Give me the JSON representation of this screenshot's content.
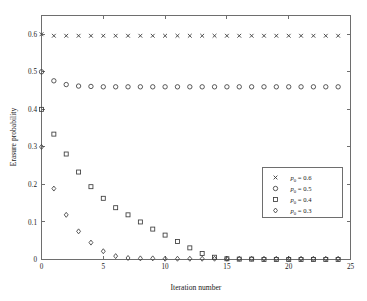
{
  "chart_data": {
    "type": "scatter",
    "title": "",
    "xlabel": "Iteration number",
    "ylabel": "Erasure probability",
    "xlim": [
      0,
      25
    ],
    "ylim": [
      0,
      0.65
    ],
    "xticks": [
      0,
      5,
      10,
      15,
      20,
      25
    ],
    "xticklabels": [
      "0",
      "5",
      "10",
      "15",
      "20",
      "25"
    ],
    "yticks": [
      0,
      0.1,
      0.2,
      0.3,
      0.4,
      0.5,
      0.6
    ],
    "yticklabels": [
      "0",
      "0.1",
      "0.2",
      "0.3",
      "0.4",
      "0.5",
      "0.6"
    ],
    "grid": false,
    "legend_position": "center-right",
    "x": [
      0,
      1,
      2,
      3,
      4,
      5,
      6,
      7,
      8,
      9,
      10,
      11,
      12,
      13,
      14,
      15,
      16,
      17,
      18,
      19,
      20,
      21,
      22,
      23,
      24
    ],
    "series": [
      {
        "name": "p_0 = 0.6",
        "marker": "x",
        "color": "#3c3c3c",
        "values": [
          0.6,
          0.596,
          0.596,
          0.596,
          0.596,
          0.596,
          0.596,
          0.596,
          0.596,
          0.596,
          0.596,
          0.596,
          0.596,
          0.596,
          0.596,
          0.596,
          0.596,
          0.596,
          0.596,
          0.596,
          0.596,
          0.596,
          0.596,
          0.596,
          0.596
        ]
      },
      {
        "name": "p_0 = 0.5",
        "marker": "o",
        "color": "#3c3c3c",
        "values": [
          0.5,
          0.476,
          0.466,
          0.462,
          0.461,
          0.46,
          0.46,
          0.46,
          0.46,
          0.46,
          0.46,
          0.46,
          0.46,
          0.46,
          0.46,
          0.46,
          0.46,
          0.46,
          0.46,
          0.46,
          0.46,
          0.46,
          0.46,
          0.46,
          0.46
        ]
      },
      {
        "name": "p_0 = 0.4",
        "marker": "s",
        "color": "#3c3c3c",
        "values": [
          0.4,
          0.334,
          0.281,
          0.233,
          0.194,
          0.163,
          0.138,
          0.119,
          0.1,
          0.081,
          0.065,
          0.048,
          0.031,
          0.016,
          0.006,
          0.002,
          0.001,
          0.001,
          0.0,
          0.0,
          0.0,
          0.0,
          0.0,
          0.0,
          0.0
        ]
      },
      {
        "name": "p_0 = 0.3",
        "marker": "d",
        "color": "#3c3c3c",
        "values": [
          0.3,
          0.189,
          0.119,
          0.075,
          0.045,
          0.022,
          0.009,
          0.004,
          0.003,
          0.003,
          0.002,
          0.002,
          0.002,
          0.002,
          0.002,
          0.002,
          0.002,
          0.002,
          0.002,
          0.002,
          0.002,
          0.002,
          0.002,
          0.002,
          0.002
        ]
      }
    ],
    "legend_entries": [
      {
        "marker": "x",
        "text": "p",
        "sub": "0",
        "rest": " = 0.6"
      },
      {
        "marker": "o",
        "text": "p",
        "sub": "0",
        "rest": " = 0.5"
      },
      {
        "marker": "s",
        "text": "p",
        "sub": "0",
        "rest": " = 0.4"
      },
      {
        "marker": "d",
        "text": "p",
        "sub": "0",
        "rest": " = 0.3"
      }
    ]
  }
}
